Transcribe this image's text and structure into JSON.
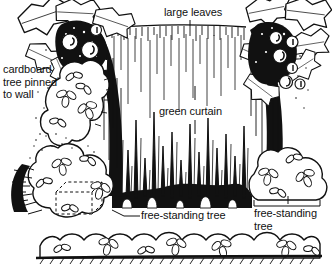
{
  "figure": {
    "kind": "line-drawing-diagram",
    "background_color": "#ffffff",
    "ink_color": "#111111",
    "width": 332,
    "height": 272
  },
  "labels": {
    "cardboard_tree": "cardboard\ntree pinned\nto wall",
    "large_leaves": "large leaves",
    "green_curtain": "green curtain",
    "free_standing_center": "free-standing tree",
    "free_standing_right": "free-standing\ntree"
  },
  "elements": {
    "left_tree": "cardboard tree pinned to wall, left",
    "right_tree": "cardboard tree pinned to wall, right",
    "curtain": "green curtain hung on rail between trees",
    "left_bushes": "tall cloud-shaped bush cluster, left",
    "lower_left_bush": "low bush cluster concealing dashed box",
    "hidden_box": "dashed hidden box inside low bush",
    "right_bush": "free-standing bush, right",
    "front_hedge": "foreground hedge strip with leaf clusters",
    "ground_line": "hatched ground line at bottom"
  }
}
